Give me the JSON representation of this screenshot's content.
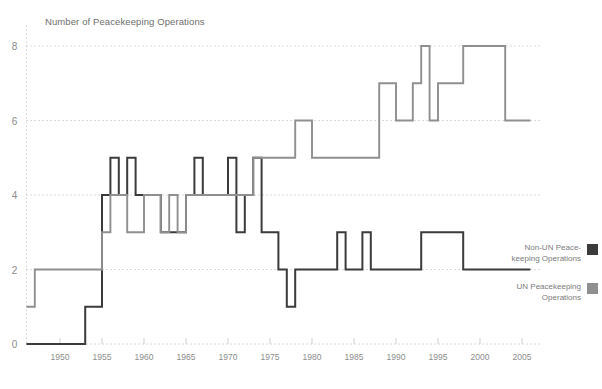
{
  "chart_data": {
    "type": "line",
    "title": "Number of Peacekeeping Operations",
    "xlabel": "",
    "ylabel": "",
    "xlim": [
      1946,
      2006
    ],
    "ylim": [
      0,
      8.6
    ],
    "yticks": [
      0,
      2,
      4,
      6,
      8
    ],
    "xticks": [
      1950,
      1955,
      1960,
      1965,
      1970,
      1975,
      1980,
      1985,
      1990,
      1995,
      2000,
      2005
    ],
    "grid": true,
    "grid_style": "dotted-horizontal",
    "legend_position": "right",
    "series": [
      {
        "name": "Non-UN Peace-keeping Operations",
        "color": "#3b3b3b",
        "x": [
          1946,
          1947,
          1948,
          1949,
          1950,
          1951,
          1952,
          1953,
          1954,
          1955,
          1956,
          1957,
          1958,
          1959,
          1960,
          1961,
          1962,
          1963,
          1964,
          1965,
          1966,
          1967,
          1968,
          1969,
          1970,
          1971,
          1972,
          1973,
          1974,
          1975,
          1976,
          1977,
          1978,
          1979,
          1980,
          1981,
          1982,
          1983,
          1984,
          1985,
          1986,
          1987,
          1988,
          1989,
          1990,
          1991,
          1992,
          1993,
          1994,
          1995,
          1996,
          1997,
          1998,
          1999,
          2000,
          2001,
          2002,
          2003,
          2004,
          2005
        ],
        "values": [
          0,
          0,
          0,
          0,
          0,
          0,
          0,
          1,
          1,
          4,
          5,
          4,
          5,
          4,
          4,
          4,
          3,
          3,
          3,
          4,
          5,
          4,
          4,
          4,
          5,
          3,
          4,
          5,
          3,
          3,
          2,
          1,
          2,
          2,
          2,
          2,
          2,
          3,
          2,
          2,
          3,
          2,
          2,
          2,
          2,
          2,
          2,
          3,
          3,
          3,
          3,
          3,
          2,
          2,
          2,
          2,
          2,
          2,
          2,
          2
        ]
      },
      {
        "name": "UN Peacekeeping Operations",
        "color": "#8f8f8f",
        "x": [
          1946,
          1947,
          1948,
          1949,
          1950,
          1951,
          1952,
          1953,
          1954,
          1955,
          1956,
          1957,
          1958,
          1959,
          1960,
          1961,
          1962,
          1963,
          1964,
          1965,
          1966,
          1967,
          1968,
          1969,
          1970,
          1971,
          1972,
          1973,
          1974,
          1975,
          1976,
          1977,
          1978,
          1979,
          1980,
          1981,
          1982,
          1983,
          1984,
          1985,
          1986,
          1987,
          1988,
          1989,
          1990,
          1991,
          1992,
          1993,
          1994,
          1995,
          1996,
          1997,
          1998,
          1999,
          2000,
          2001,
          2002,
          2003,
          2004,
          2005
        ],
        "values": [
          1,
          2,
          2,
          2,
          2,
          2,
          2,
          2,
          2,
          3,
          4,
          4,
          3,
          3,
          4,
          4,
          3,
          4,
          3,
          4,
          4,
          4,
          4,
          4,
          4,
          4,
          4,
          5,
          5,
          5,
          5,
          5,
          6,
          6,
          5,
          5,
          5,
          5,
          5,
          5,
          5,
          5,
          7,
          7,
          6,
          6,
          7,
          8,
          6,
          7,
          7,
          7,
          8,
          8,
          8,
          8,
          8,
          6,
          6,
          6
        ]
      }
    ]
  },
  "legend": {
    "items": [
      {
        "label": "Non-UN Peace-\nkeeping Operations",
        "color": "#3b3b3b"
      },
      {
        "label": "UN Peacekeeping\nOperations",
        "color": "#8f8f8f"
      }
    ]
  },
  "axes": {
    "y_tick_labels": [
      "0",
      "2",
      "4",
      "6",
      "8"
    ],
    "x_tick_labels": [
      "1950",
      "1955",
      "1960",
      "1965",
      "1970",
      "1975",
      "1980",
      "1985",
      "1990",
      "1995",
      "2000",
      "2005"
    ]
  }
}
